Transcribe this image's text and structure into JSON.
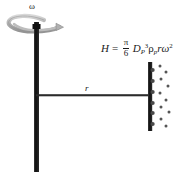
{
  "figure": {
    "background_color": "#ffffff",
    "width": 195,
    "height": 176
  },
  "labels": {
    "omega": "ω",
    "radius": "r"
  },
  "equation": {
    "lhs": "H",
    "equals": "=",
    "fraction_numerator": "π",
    "fraction_denominator": "6",
    "term_diameter": "D",
    "term_diameter_sub": "P",
    "term_diameter_sup": "3",
    "term_density": "ρ",
    "term_density_sub": "p",
    "term_radius": "r",
    "term_omega": "ω",
    "term_omega_sup": "2",
    "plain_text": "H = (π/6) D_P^3 ρ_p r ω^2"
  },
  "colors": {
    "mast": "#141414",
    "plate": "#141414",
    "arm": "#2b2b2b",
    "arrow_loop": "#a8a8a8",
    "arrow_loop_edge": "#8a8a8a",
    "particles": "#4a4a4a",
    "text": "#1a1a1a"
  },
  "geometry": {
    "mast": {
      "x": 34,
      "y_top": 24,
      "y_bottom": 172,
      "width": 5
    },
    "arm": {
      "x_start": 36,
      "x_end": 150,
      "y": 95,
      "thickness": 2
    },
    "plate": {
      "x": 148,
      "y_top": 62,
      "y_bottom": 131,
      "width": 4
    },
    "rotation_arrow": {
      "cx": 36,
      "cy": 24,
      "rx": 27,
      "ry": 7
    }
  },
  "particles_on_plate": [
    {
      "x": 152,
      "y": 70
    },
    {
      "x": 152,
      "y": 81
    },
    {
      "x": 152,
      "y": 92
    },
    {
      "x": 152,
      "y": 103
    },
    {
      "x": 152,
      "y": 113
    },
    {
      "x": 152,
      "y": 124
    }
  ],
  "particles_scattered": [
    {
      "x": 160,
      "y": 66
    },
    {
      "x": 165,
      "y": 72
    },
    {
      "x": 161,
      "y": 79
    },
    {
      "x": 168,
      "y": 86
    },
    {
      "x": 160,
      "y": 93
    },
    {
      "x": 166,
      "y": 100
    },
    {
      "x": 161,
      "y": 107
    },
    {
      "x": 169,
      "y": 112
    },
    {
      "x": 161,
      "y": 119
    },
    {
      "x": 166,
      "y": 126
    }
  ]
}
